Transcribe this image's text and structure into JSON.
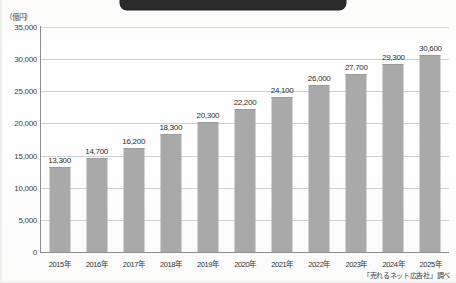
{
  "banner": {
    "text": ""
  },
  "axis": {
    "y_unit_label": "（億円）",
    "y_ticks": [
      "35,000",
      "30,000",
      "25,000",
      "20,000",
      "15,000",
      "10,000",
      "5,000",
      "0"
    ]
  },
  "source": {
    "note": "「売れるネット広告社」調べ"
  },
  "chart_data": {
    "type": "bar",
    "title": "",
    "xlabel": "",
    "ylabel": "（億円）",
    "ylim": [
      0,
      35000
    ],
    "ytick_interval": 5000,
    "grid": true,
    "legend": "none",
    "bar_color": "#a9a9a9",
    "categories": [
      "2015年",
      "2016年",
      "2017年",
      "2018年",
      "2019年",
      "2020年",
      "2021年",
      "2022年",
      "2023年",
      "2024年",
      "2025年"
    ],
    "values": [
      13300,
      14700,
      16200,
      18300,
      20300,
      22200,
      24100,
      26000,
      27700,
      29300,
      30600
    ],
    "value_labels": [
      "13,300",
      "14,700",
      "16,200",
      "18,300",
      "20,300",
      "22,200",
      "24,100",
      "26,000",
      "27,700",
      "29,300",
      "30,600"
    ],
    "annotations": [
      "「売れるネット広告社」調べ"
    ]
  }
}
